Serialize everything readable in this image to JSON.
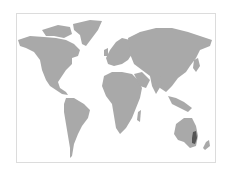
{
  "map": {
    "type": "world-map",
    "projection": "equirectangular-like",
    "colors": {
      "land": "#a9a9a9",
      "highlight": "#555555",
      "frame_border": "#dcdcdc",
      "background": "#ffffff"
    },
    "highlighted_regions": [
      {
        "name": "eastern-australia",
        "description": "East coast of Australia (Queensland / New South Wales)"
      }
    ]
  }
}
